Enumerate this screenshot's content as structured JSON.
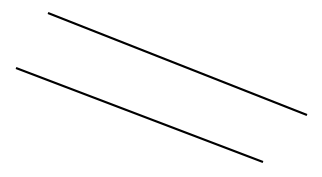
{
  "diagram": {
    "background": "#ffffff",
    "stroke_color": "#000000",
    "stroke_width": 2.2,
    "lines": [
      {
        "id": "line-upper",
        "x1": 48,
        "y1": 13,
        "x2": 307,
        "y2": 115
      },
      {
        "id": "line-lower",
        "x1": 16,
        "y1": 68,
        "x2": 263,
        "y2": 162
      }
    ]
  }
}
